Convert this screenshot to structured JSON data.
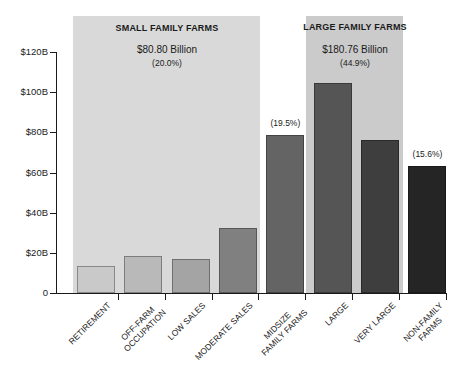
{
  "chart_data": {
    "type": "bar",
    "title": "",
    "xlabel": "",
    "ylabel": "",
    "grid": false,
    "legend": "none",
    "ylim": [
      0,
      120
    ],
    "y_axis": {
      "tick_labels": [
        "$120B",
        "$100B",
        "$80B",
        "$60B",
        "$40B",
        "$20B",
        "0"
      ],
      "tick_values": [
        120,
        100,
        80,
        60,
        40,
        20,
        0
      ]
    },
    "categories": [
      "RETIREMENT",
      "OFF-FARM\nOCCUPATION",
      "LOW SALES",
      "MODERATE SALES",
      "MIDSIZE\nFAMILY FARMS",
      "LARGE",
      "VERY LARGE",
      "NON-FAMILY\nFARMS"
    ],
    "values": [
      13.4,
      18.3,
      16.8,
      32.3,
      78.8,
      104.5,
      76.3,
      63.0
    ],
    "values_unit": "billion USD (estimated from axis)",
    "bar_colors": [
      "#c9c9c9",
      "#b9b9b9",
      "#a4a4a4",
      "#808080",
      "#646464",
      "#555555",
      "#3e3e3e",
      "#252525"
    ],
    "bar_annotations": [
      "",
      "",
      "",
      "",
      "(19.5%)",
      "",
      "",
      "(15.6%)"
    ],
    "groups": [
      {
        "label": "SMALL FAMILY FARMS",
        "value_label": "$80.80 Billion",
        "pct_label": "(20.0%)",
        "bars": "RETIREMENT–MODERATE SALES",
        "bg_color": "#d9d9d9"
      },
      {
        "label": "LARGE FAMILY FARMS",
        "value_label": "$180.76 Billion",
        "pct_label": "(44.9%)",
        "bars": "LARGE–VERY LARGE",
        "bg_color": "#cbcbcb"
      }
    ]
  }
}
